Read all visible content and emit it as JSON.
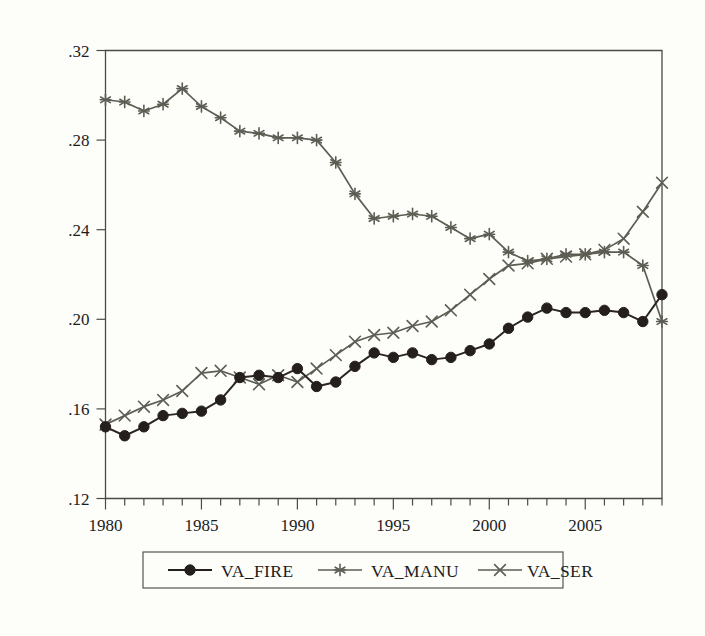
{
  "chart_data": {
    "type": "line",
    "title": "",
    "subtitle": "",
    "xlabel": "",
    "ylabel": "",
    "xlim": [
      1980,
      2009
    ],
    "ylim": [
      0.12,
      0.32
    ],
    "grid": false,
    "legend_position": "bottom-center",
    "x_tick_labels": [
      "1980",
      "1985",
      "1990",
      "1995",
      "2000",
      "2005"
    ],
    "x_tick_values": [
      1980,
      1985,
      1990,
      1995,
      2000,
      2005
    ],
    "x_minor_ticks_every": 1,
    "y_tick_labels": [
      ".12",
      ".16",
      ".20",
      ".24",
      ".28",
      ".32"
    ],
    "y_tick_values": [
      0.12,
      0.16,
      0.2,
      0.24,
      0.28,
      0.32
    ],
    "x": [
      1980,
      1981,
      1982,
      1983,
      1984,
      1985,
      1986,
      1987,
      1988,
      1989,
      1990,
      1991,
      1992,
      1993,
      1994,
      1995,
      1996,
      1997,
      1998,
      1999,
      2000,
      2001,
      2002,
      2003,
      2004,
      2005,
      2006,
      2007,
      2008,
      2009
    ],
    "series": [
      {
        "name": "VA_FIRE",
        "marker": "filled-circle",
        "color": "#241f1d",
        "values": [
          0.152,
          0.148,
          0.152,
          0.157,
          0.158,
          0.159,
          0.164,
          0.174,
          0.175,
          0.174,
          0.178,
          0.17,
          0.172,
          0.179,
          0.185,
          0.183,
          0.185,
          0.182,
          0.183,
          0.186,
          0.189,
          0.196,
          0.201,
          0.205,
          0.203,
          0.203,
          0.204,
          0.203,
          0.199,
          0.211
        ]
      },
      {
        "name": "VA_MANU",
        "marker": "asterisk",
        "color": "#5d5d54",
        "values": [
          0.298,
          0.297,
          0.293,
          0.296,
          0.303,
          0.295,
          0.29,
          0.284,
          0.283,
          0.281,
          0.281,
          0.28,
          0.27,
          0.256,
          0.245,
          0.246,
          0.247,
          0.246,
          0.241,
          0.236,
          0.238,
          0.23,
          0.226,
          0.227,
          0.229,
          0.229,
          0.23,
          0.23,
          0.224,
          0.199
        ]
      },
      {
        "name": "VA_SER",
        "marker": "x-cross",
        "color": "#5d5d54",
        "values": [
          0.153,
          0.157,
          0.161,
          0.164,
          0.168,
          0.176,
          0.177,
          0.174,
          0.171,
          0.175,
          0.172,
          0.178,
          0.184,
          0.19,
          0.193,
          0.194,
          0.197,
          0.199,
          0.204,
          0.211,
          0.218,
          0.224,
          0.225,
          0.227,
          0.228,
          0.229,
          0.231,
          0.236,
          0.248,
          0.261
        ]
      }
    ]
  },
  "legend": {
    "entries": [
      {
        "label": "VA_FIRE",
        "marker": "filled-circle"
      },
      {
        "label": "VA_MANU",
        "marker": "asterisk"
      },
      {
        "label": "VA_SER",
        "marker": "x-cross"
      }
    ]
  },
  "colors": {
    "background": "#fdfdfa",
    "axis": "#4a4a46",
    "text": "#1c1c1c",
    "series_dark": "#241f1d",
    "series_gray": "#5d5d54"
  }
}
